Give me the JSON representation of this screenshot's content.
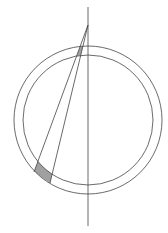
{
  "diagram": {
    "colors": {
      "line": "#444444",
      "shade": "#a0a0a0",
      "background": "#ffffff"
    },
    "elements": [
      "outer-circle",
      "inner-circle",
      "vertical-axis",
      "wedge-line-left",
      "wedge-line-right",
      "upper-shaded-region",
      "lower-shaded-region"
    ]
  }
}
